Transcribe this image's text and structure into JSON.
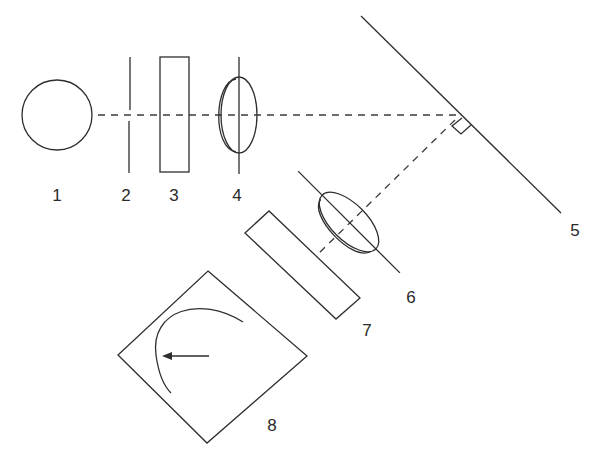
{
  "diagram": {
    "type": "optical schematic",
    "labels": [
      {
        "id": "1",
        "text": "1",
        "x": 57,
        "y": 201
      },
      {
        "id": "2",
        "text": "2",
        "x": 126,
        "y": 201
      },
      {
        "id": "3",
        "text": "3",
        "x": 174,
        "y": 201
      },
      {
        "id": "4",
        "text": "4",
        "x": 237,
        "y": 201
      },
      {
        "id": "5",
        "text": "5",
        "x": 575,
        "y": 236
      },
      {
        "id": "6",
        "text": "6",
        "x": 411,
        "y": 303
      },
      {
        "id": "7",
        "text": "7",
        "x": 367,
        "y": 336
      },
      {
        "id": "8",
        "text": "8",
        "x": 272,
        "y": 431
      }
    ],
    "components": [
      {
        "id": "1",
        "shape": "circle"
      },
      {
        "id": "2",
        "shape": "vertical line (aperture)"
      },
      {
        "id": "3",
        "shape": "rectangle (plate)"
      },
      {
        "id": "4",
        "shape": "lens"
      },
      {
        "id": "5",
        "shape": "diagonal mirror"
      },
      {
        "id": "6",
        "shape": "tilted lens"
      },
      {
        "id": "7",
        "shape": "tilted rectangle (plate)"
      },
      {
        "id": "8",
        "shape": "diamond with curved arc and arrow"
      }
    ],
    "colors": {
      "stroke": "#2e2e2e",
      "background": "#ffffff"
    }
  }
}
